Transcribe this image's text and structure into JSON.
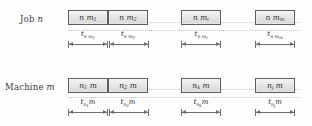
{
  "figure": {
    "background": "#fdfdfd",
    "block_border_color": "#5d5d5d",
    "block_fill_top": "#f4f4f4",
    "block_fill_bottom": "#d8d8d8",
    "dim_line_color": "#6f6f6f",
    "connector_color": "#c2c2c2"
  },
  "rows": [
    {
      "id": "job-row",
      "label_prefix": "Job",
      "label_symbol": "n",
      "blocks": [
        {
          "base": "n m",
          "sub": "1",
          "duration_base": "t",
          "duration_sub": "n m",
          "duration_subsub": "1"
        },
        {
          "base": "n m",
          "sub": "2",
          "duration_base": "t",
          "duration_sub": "n m",
          "duration_subsub": "2"
        },
        {
          "base": "n m",
          "sub": "i",
          "duration_base": "t",
          "duration_sub": "n m",
          "duration_subsub": "i"
        },
        {
          "base": "n m",
          "sub": "m",
          "duration_base": "t",
          "duration_sub": "n m",
          "duration_subsub": "m"
        }
      ]
    },
    {
      "id": "machine-row",
      "label_prefix": "Machine",
      "label_symbol": "m",
      "blocks": [
        {
          "base": "n",
          "sub": "1",
          "base_suffix": " m",
          "duration_base": "t",
          "duration_sub": "n",
          "duration_subsub": "1",
          "duration_suffix": "m"
        },
        {
          "base": "n",
          "sub": "2",
          "base_suffix": " m",
          "duration_base": "t",
          "duration_sub": "n",
          "duration_subsub": "2",
          "duration_suffix": "m"
        },
        {
          "base": "n",
          "sub": "k",
          "base_suffix": " m",
          "duration_base": "t",
          "duration_sub": "n",
          "duration_subsub": "k",
          "duration_suffix": "m"
        },
        {
          "base": "n",
          "sub": "j",
          "base_suffix": " m",
          "duration_base": "t",
          "duration_sub": "n",
          "duration_subsub": "j",
          "duration_suffix": "m"
        }
      ]
    }
  ]
}
